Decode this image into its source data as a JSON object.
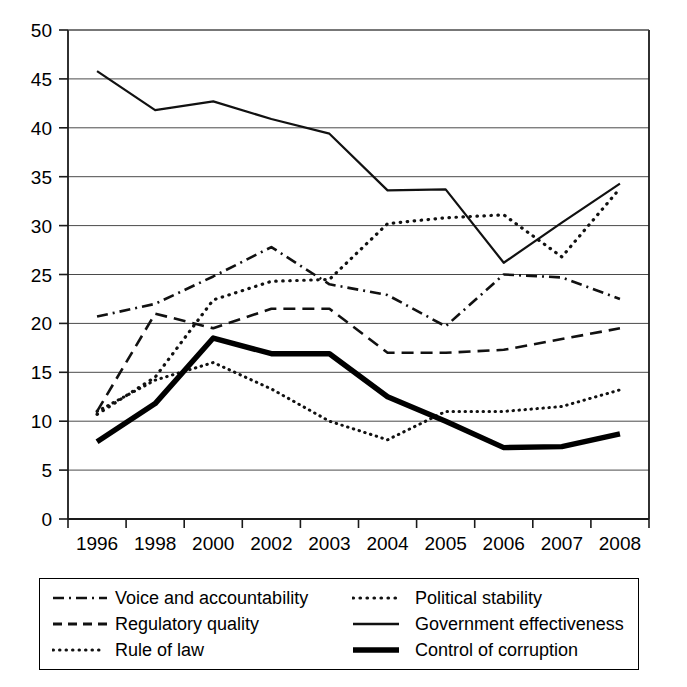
{
  "chart_data": {
    "type": "line",
    "title": "",
    "subtitle": "",
    "xlabel": "",
    "ylabel": "",
    "categories": [
      "1996",
      "1998",
      "2000",
      "2002",
      "2003",
      "2004",
      "2005",
      "2006",
      "2007",
      "2008"
    ],
    "x": [
      1996,
      1998,
      2000,
      2002,
      2003,
      2004,
      2005,
      2006,
      2007,
      2008
    ],
    "ylim": [
      0,
      50
    ],
    "yticks": [
      0,
      5,
      10,
      15,
      20,
      25,
      30,
      35,
      40,
      45,
      50
    ],
    "ytick_labels": [
      "0",
      "5",
      "10",
      "15",
      "20",
      "25",
      "30",
      "35",
      "40",
      "45",
      "50"
    ],
    "grid": "horizontal",
    "legend_position": "below-plot",
    "series": [
      {
        "name": "Voice and accountability",
        "style": "dash-dot",
        "stroke": "#111111",
        "width": 2.6,
        "dasharray": "11,5,2,5",
        "values": [
          20.7,
          22.0,
          24.8,
          27.8,
          24.0,
          22.9,
          19.7,
          25.0,
          24.7,
          22.5
        ]
      },
      {
        "name": "Regulatory quality",
        "style": "dashed",
        "stroke": "#111111",
        "width": 2.6,
        "dasharray": "12,7",
        "values": [
          11.0,
          21.0,
          19.5,
          21.5,
          21.5,
          17.0,
          17.0,
          17.3,
          18.4,
          19.5
        ]
      },
      {
        "name": "Rule of law",
        "style": "dotted",
        "stroke": "#111111",
        "width": 3.0,
        "dasharray": "0.5,5.5",
        "values": [
          11.0,
          14.2,
          16.0,
          13.3,
          10.0,
          8.1,
          11.0,
          11.0,
          11.5,
          13.2
        ]
      },
      {
        "name": "Political stability",
        "style": "dotted-coarse",
        "stroke": "#111111",
        "width": 3.2,
        "dasharray": "0.5,6.5",
        "values": [
          10.7,
          14.5,
          22.4,
          24.3,
          24.5,
          30.2,
          30.8,
          31.1,
          26.8,
          33.8
        ]
      },
      {
        "name": "Government effectiveness",
        "style": "solid",
        "stroke": "#111111",
        "width": 2.2,
        "dasharray": "none",
        "values": [
          45.8,
          41.8,
          42.7,
          40.9,
          39.4,
          33.6,
          33.7,
          26.2,
          30.3,
          34.3
        ]
      },
      {
        "name": "Control of corruption",
        "style": "solid-thick",
        "stroke": "#000000",
        "width": 5.4,
        "dasharray": "none",
        "values": [
          7.9,
          11.8,
          18.5,
          16.9,
          16.9,
          12.5,
          10.0,
          7.3,
          7.4,
          8.7
        ]
      }
    ]
  },
  "legend": {
    "rows": [
      {
        "left": "Voice and accountability",
        "right": "Political stability"
      },
      {
        "left": "Regulatory quality",
        "right": "Government effectiveness"
      },
      {
        "left": "Rule of law",
        "right": "Control of corruption"
      }
    ]
  }
}
